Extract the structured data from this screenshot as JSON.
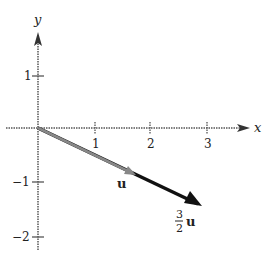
{
  "axes": {
    "x_label": "x",
    "y_label": "y",
    "x_ticks": [
      "1",
      "2",
      "3"
    ],
    "y_ticks": [
      "1",
      "−1",
      "−2"
    ]
  },
  "vectors": {
    "u": {
      "label": "u",
      "start": [
        0,
        0
      ],
      "end": [
        1.75,
        -0.85
      ]
    },
    "three_halves_u": {
      "label_num": "3",
      "label_den": "2",
      "label_var": "u",
      "start": [
        0,
        0
      ],
      "end": [
        2.9,
        -1.4
      ]
    }
  },
  "colors": {
    "axis": "#444444",
    "vector_u": "#777777",
    "vector_scaled": "#111111"
  }
}
